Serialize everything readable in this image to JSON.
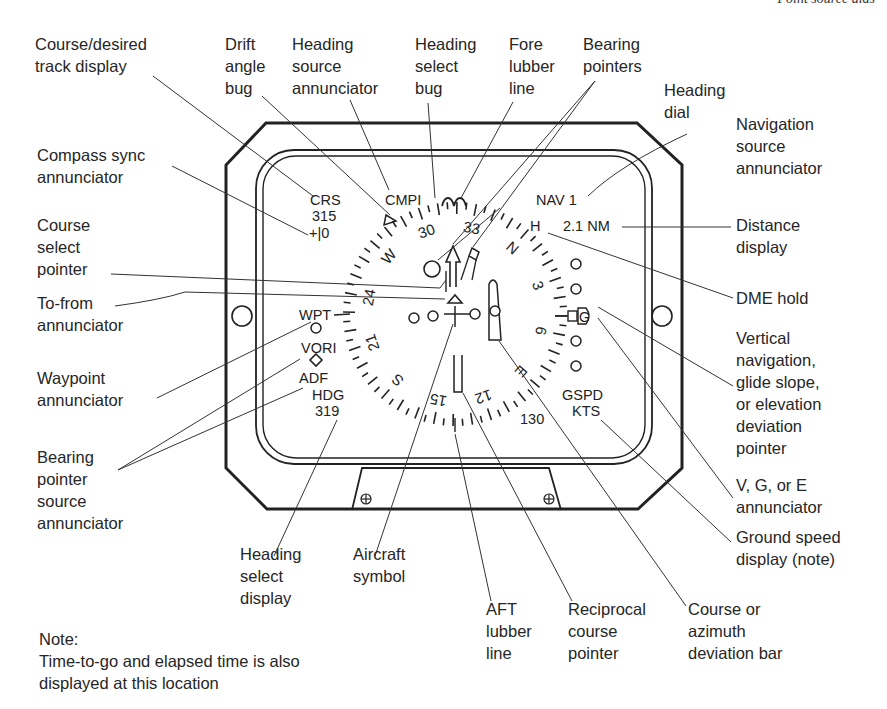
{
  "header": {
    "running_title": "Point source aids"
  },
  "instrument": {
    "crs_label": "CRS",
    "crs_value": "315",
    "compass_sync": "+|0",
    "heading_source": "CMPI",
    "nav_source": "NAV 1",
    "dme_hold": "H",
    "distance": "2.1 NM",
    "wpt": "WPT",
    "vori": "VORI",
    "adf": "ADF",
    "hdg_label": "HDG",
    "hdg_value": "319",
    "gspd_label": "GSPD",
    "gspd_units": "KTS",
    "gspd_value": "130",
    "vge_letter": "G",
    "dial_labels": [
      "30",
      "33",
      "N",
      "3",
      "6",
      "E",
      "12",
      "15",
      "S",
      "21",
      "24",
      "W"
    ]
  },
  "callouts": {
    "course_display": "Course/desired\ntrack display",
    "drift_bug": "Drift\nangle\nbug",
    "heading_source": "Heading\nsource\nannunciator",
    "heading_select_bug": "Heading\nselect\nbug",
    "fore_lubber": "Fore\nlubber\nline",
    "bearing_pointers": "Bearing\npointers",
    "heading_dial": "Heading\ndial",
    "nav_source": "Navigation\nsource\nannunciator",
    "compass_sync": "Compass sync\nannunciator",
    "course_select": "Course\nselect\npointer",
    "distance_display": "Distance\ndisplay",
    "to_from": "To-from\nannunciator",
    "dme_hold": "DME hold",
    "waypoint": "Waypoint\nannunciator",
    "vertical_nav": "Vertical\nnavigation,\nglide slope,\nor elevation\ndeviation\npointer",
    "bearing_source": "Bearing\npointer\nsource\nannunciator",
    "vge": "V, G, or E\nannunciator",
    "heading_select_display": "Heading\nselect\ndisplay",
    "aircraft_symbol": "Aircraft\nsymbol",
    "ground_speed": "Ground speed\ndisplay (note)",
    "aft_lubber": "AFT\nlubber\nline",
    "reciprocal_course": "Reciprocal\ncourse\npointer",
    "deviation_bar": "Course or\nazimuth\ndeviation bar"
  },
  "note": {
    "title": "Note:",
    "text": "Time-to-go and elapsed time is also\ndisplayed at this location"
  }
}
